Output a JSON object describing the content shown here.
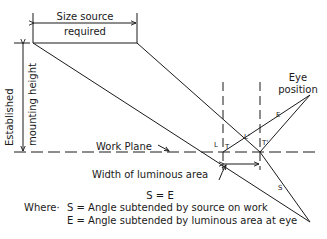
{
  "diagram": {
    "labels": {
      "size_source_line1": "Size source",
      "size_source_line2": "required",
      "mounting_height_line1": "Established",
      "mounting_height_line2": "mounting height",
      "eye_position_line1": "Eye",
      "eye_position_line2": "position",
      "work_plane": "Work Plane",
      "width_luminous_area": "Width of luminous area",
      "point_L": "L",
      "point_T": "T",
      "point_L_prime": "L'",
      "point_T_prime": "T'",
      "angle_E": "E",
      "angle_S": "S"
    },
    "equation": "S = E",
    "legend": {
      "where_prefix": "Where·",
      "s_def": "S = Angle subtended by source on work",
      "e_def": "E = Angle subtended by luminous area at eye"
    },
    "colors": {
      "ink": "#1a1a1a",
      "background": "#ffffff"
    }
  }
}
